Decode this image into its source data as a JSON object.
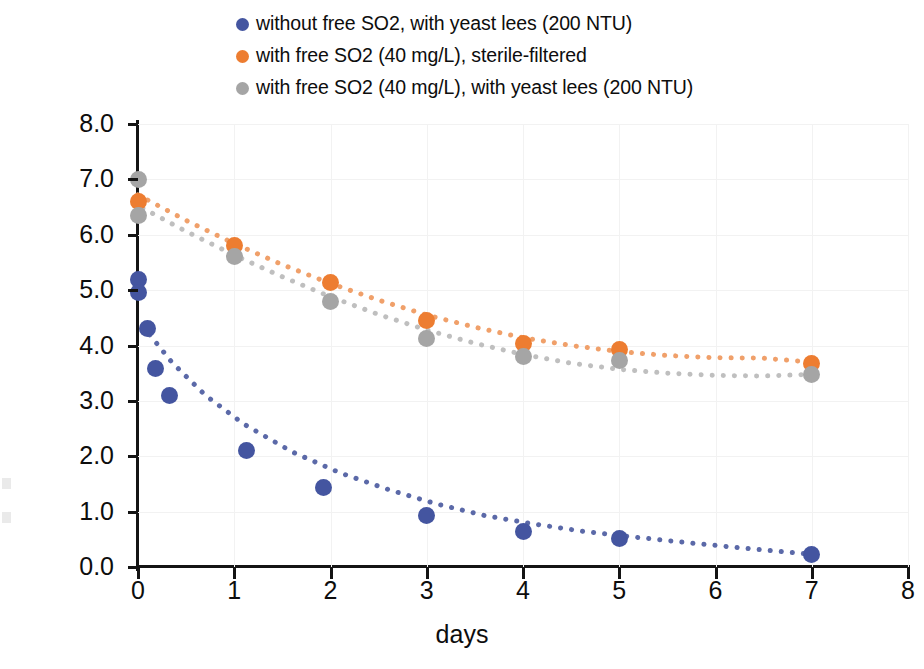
{
  "axes": {
    "xlabel": "days",
    "ylabel": "DO, mg/L",
    "xticks": [
      "0",
      "1",
      "2",
      "3",
      "4",
      "5",
      "6",
      "7",
      "8"
    ],
    "yticks": [
      "0.0",
      "1.0",
      "2.0",
      "3.0",
      "4.0",
      "5.0",
      "6.0",
      "7.0",
      "8.0"
    ]
  },
  "legend": {
    "items": [
      {
        "label": "without free SO2, with yeast lees (200 NTU)",
        "color": "#4455A0"
      },
      {
        "label": "with free SO2 (40 mg/L), sterile-filtered",
        "color": "#ED7D31"
      },
      {
        "label": "with free SO2 (40 mg/L), with yeast lees (200 NTU)",
        "color": "#A5A5A5"
      }
    ]
  },
  "chart_data": {
    "type": "scatter",
    "title": "",
    "xlabel": "days",
    "ylabel": "DO, mg/L",
    "xlim": [
      0,
      8
    ],
    "ylim": [
      0,
      8
    ],
    "xtick_step": 1,
    "ytick_step": 1,
    "grid": true,
    "legend_position": "top",
    "marker_style": "filled-circle",
    "trendline_style": "dotted",
    "series": [
      {
        "name": "without free SO2, with yeast lees (200 NTU)",
        "color": "#4455A0",
        "trendline_color": "#5B69A8",
        "points": [
          {
            "x": 0.0,
            "y": 5.2
          },
          {
            "x": 0.0,
            "y": 4.95
          },
          {
            "x": 0.1,
            "y": 4.3
          },
          {
            "x": 0.18,
            "y": 3.58
          },
          {
            "x": 0.33,
            "y": 3.1
          },
          {
            "x": 1.13,
            "y": 2.1
          },
          {
            "x": 1.93,
            "y": 1.43
          },
          {
            "x": 3.0,
            "y": 0.93
          },
          {
            "x": 4.0,
            "y": 0.65
          },
          {
            "x": 5.0,
            "y": 0.52
          },
          {
            "x": 7.0,
            "y": 0.22
          }
        ],
        "trendline": [
          {
            "x": 0.05,
            "y": 4.35
          },
          {
            "x": 0.35,
            "y": 3.7
          },
          {
            "x": 0.7,
            "y": 3.1
          },
          {
            "x": 1.1,
            "y": 2.58
          },
          {
            "x": 1.6,
            "y": 2.08
          },
          {
            "x": 2.1,
            "y": 1.7
          },
          {
            "x": 2.6,
            "y": 1.4
          },
          {
            "x": 3.1,
            "y": 1.14
          },
          {
            "x": 3.6,
            "y": 0.93
          },
          {
            "x": 4.1,
            "y": 0.78
          },
          {
            "x": 4.6,
            "y": 0.65
          },
          {
            "x": 5.1,
            "y": 0.55
          },
          {
            "x": 5.7,
            "y": 0.44
          },
          {
            "x": 6.3,
            "y": 0.34
          },
          {
            "x": 6.8,
            "y": 0.26
          },
          {
            "x": 7.0,
            "y": 0.23
          }
        ]
      },
      {
        "name": "with free SO2 (40 mg/L), sterile-filtered",
        "color": "#ED7D31",
        "trendline_color": "#F0A06A",
        "points": [
          {
            "x": 0.0,
            "y": 6.6
          },
          {
            "x": 1.0,
            "y": 5.8
          },
          {
            "x": 2.0,
            "y": 5.13
          },
          {
            "x": 3.0,
            "y": 4.46
          },
          {
            "x": 4.0,
            "y": 4.03
          },
          {
            "x": 5.0,
            "y": 3.92
          },
          {
            "x": 7.0,
            "y": 3.68
          }
        ],
        "trendline": [
          {
            "x": 0.0,
            "y": 6.72
          },
          {
            "x": 0.5,
            "y": 6.26
          },
          {
            "x": 1.0,
            "y": 5.84
          },
          {
            "x": 1.5,
            "y": 5.46
          },
          {
            "x": 2.0,
            "y": 5.12
          },
          {
            "x": 2.5,
            "y": 4.82
          },
          {
            "x": 3.0,
            "y": 4.55
          },
          {
            "x": 3.5,
            "y": 4.33
          },
          {
            "x": 4.0,
            "y": 4.14
          },
          {
            "x": 4.5,
            "y": 4.0
          },
          {
            "x": 5.0,
            "y": 3.89
          },
          {
            "x": 5.5,
            "y": 3.82
          },
          {
            "x": 6.0,
            "y": 3.78
          },
          {
            "x": 6.5,
            "y": 3.77
          },
          {
            "x": 7.0,
            "y": 3.7
          }
        ]
      },
      {
        "name": "with free SO2 (40 mg/L), with yeast lees (200 NTU)",
        "color": "#A5A5A5",
        "trendline_color": "#BFBFBF",
        "points": [
          {
            "x": 0.0,
            "y": 7.0
          },
          {
            "x": 0.0,
            "y": 6.35
          },
          {
            "x": 1.0,
            "y": 5.6
          },
          {
            "x": 2.0,
            "y": 4.8
          },
          {
            "x": 3.0,
            "y": 4.13
          },
          {
            "x": 4.0,
            "y": 3.81
          },
          {
            "x": 5.0,
            "y": 3.73
          },
          {
            "x": 7.0,
            "y": 3.47
          }
        ],
        "trendline": [
          {
            "x": 0.05,
            "y": 6.48
          },
          {
            "x": 0.5,
            "y": 6.06
          },
          {
            "x": 1.0,
            "y": 5.63
          },
          {
            "x": 1.5,
            "y": 5.24
          },
          {
            "x": 2.0,
            "y": 4.88
          },
          {
            "x": 2.5,
            "y": 4.56
          },
          {
            "x": 3.0,
            "y": 4.28
          },
          {
            "x": 3.5,
            "y": 4.04
          },
          {
            "x": 4.0,
            "y": 3.84
          },
          {
            "x": 4.5,
            "y": 3.68
          },
          {
            "x": 5.0,
            "y": 3.57
          },
          {
            "x": 5.5,
            "y": 3.5
          },
          {
            "x": 6.0,
            "y": 3.46
          },
          {
            "x": 6.5,
            "y": 3.45
          },
          {
            "x": 7.0,
            "y": 3.48
          }
        ]
      }
    ]
  }
}
